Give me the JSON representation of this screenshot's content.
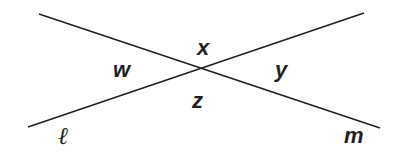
{
  "diagram": {
    "type": "intersecting-lines",
    "line_color": "#231f20",
    "lines": [
      {
        "name": "l",
        "label": "ℓ",
        "x1": 28,
        "y1": 127,
        "x2": 364,
        "y2": 13
      },
      {
        "name": "m",
        "label": "m",
        "x1": 39,
        "y1": 14,
        "x2": 380,
        "y2": 128
      }
    ],
    "angles": {
      "x": "x",
      "y": "y",
      "z": "z",
      "w": "w"
    }
  }
}
